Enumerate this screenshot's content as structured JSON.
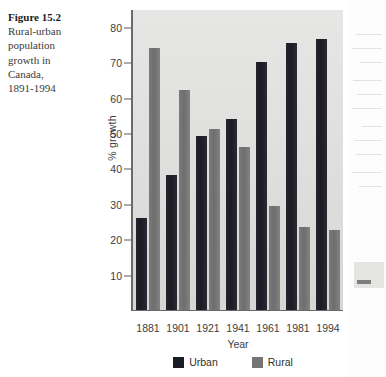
{
  "caption": {
    "title": "Figure 15.2",
    "body": "Rural-urban population growth in Canada, 1891-1994"
  },
  "chart_data": {
    "type": "bar",
    "title": "",
    "xlabel": "Year",
    "ylabel": "% growth",
    "categories": [
      "1881",
      "1901",
      "1921",
      "1941",
      "1961",
      "1981",
      "1994"
    ],
    "series": [
      {
        "name": "Urban",
        "color": "#1b1b24",
        "values": [
          26,
          38,
          49,
          54,
          70,
          75.5,
          76.5
        ]
      },
      {
        "name": "Rural",
        "color": "#757575",
        "values": [
          74,
          62,
          51,
          46,
          29.5,
          23.5,
          22.5
        ]
      }
    ],
    "ylim": [
      0,
      85
    ],
    "yticks": [
      10,
      20,
      30,
      40,
      50,
      60,
      70,
      80
    ],
    "grid": false,
    "legend_position": "bottom"
  }
}
